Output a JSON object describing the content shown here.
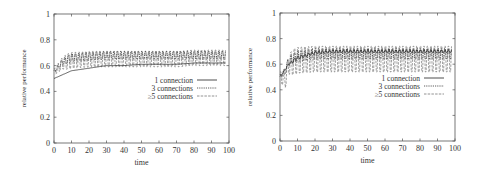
{
  "chart_data": [
    {
      "type": "line",
      "title": "",
      "xlabel": "time",
      "ylabel": "relative performance",
      "xlim": [
        0,
        100
      ],
      "ylim": [
        0,
        1
      ],
      "xticks": [
        "0",
        "10",
        "20",
        "30",
        "40",
        "50",
        "60",
        "70",
        "80",
        "90",
        "100"
      ],
      "yticks": [
        "0",
        "0.2",
        "0.4",
        "0.6",
        "0.8",
        "1"
      ],
      "grid": false,
      "legend_position": "center-right",
      "series": [
        {
          "name": "1 connection",
          "style": "solid",
          "baseline_start": 0.5,
          "baseline_end": 0.61,
          "oscillation": 0.0
        },
        {
          "name": "3 connections",
          "style": "dotted",
          "baseline_start": 0.55,
          "baseline_end": 0.68,
          "oscillation": 0.03
        },
        {
          "name": "≥5 connections",
          "style": "dashed",
          "baseline_start": 0.55,
          "baseline_end": 0.65,
          "oscillation": 0.06
        }
      ],
      "approx_points": {
        "x": [
          0,
          5,
          10,
          20,
          30,
          40,
          50,
          60,
          70,
          80,
          90,
          98
        ],
        "1 connection": [
          0.5,
          0.53,
          0.56,
          0.58,
          0.6,
          0.6,
          0.61,
          0.61,
          0.61,
          0.62,
          0.62,
          0.62
        ],
        "3 connections": [
          0.55,
          0.63,
          0.66,
          0.67,
          0.68,
          0.68,
          0.68,
          0.68,
          0.68,
          0.68,
          0.68,
          0.68
        ],
        "≥5 connections": [
          0.55,
          0.62,
          0.64,
          0.65,
          0.65,
          0.65,
          0.65,
          0.65,
          0.65,
          0.66,
          0.66,
          0.66
        ]
      }
    },
    {
      "type": "line",
      "title": "",
      "xlabel": "time",
      "ylabel": "relative performance",
      "xlim": [
        0,
        100
      ],
      "ylim": [
        0,
        1
      ],
      "xticks": [
        "0",
        "10",
        "20",
        "30",
        "40",
        "50",
        "60",
        "70",
        "80",
        "90",
        "100"
      ],
      "yticks": [
        "0",
        "0.2",
        "0.4",
        "0.6",
        "0.8",
        "1"
      ],
      "grid": false,
      "legend_position": "center-right",
      "series": [
        {
          "name": "1 connection",
          "style": "solid",
          "baseline_start": 0.5,
          "baseline_end": 0.7,
          "oscillation": 0.01
        },
        {
          "name": "3 connections",
          "style": "dotted",
          "baseline_start": 0.5,
          "baseline_end": 0.68,
          "oscillation": 0.04
        },
        {
          "name": "≥5 connections",
          "style": "dashed",
          "baseline_start": 0.5,
          "baseline_end": 0.64,
          "oscillation": 0.1
        }
      ],
      "approx_points": {
        "x": [
          0,
          3,
          5,
          10,
          20,
          30,
          40,
          50,
          60,
          70,
          80,
          90,
          98
        ],
        "1 connection": [
          0.5,
          0.56,
          0.6,
          0.65,
          0.69,
          0.7,
          0.7,
          0.7,
          0.7,
          0.7,
          0.7,
          0.7,
          0.7
        ],
        "3 connections": [
          0.5,
          0.55,
          0.62,
          0.66,
          0.68,
          0.68,
          0.68,
          0.68,
          0.68,
          0.68,
          0.68,
          0.68,
          0.68
        ],
        "≥5 connections": [
          0.5,
          0.48,
          0.6,
          0.63,
          0.64,
          0.64,
          0.64,
          0.64,
          0.64,
          0.64,
          0.64,
          0.64,
          0.64
        ]
      }
    }
  ],
  "layout": {
    "plots": [
      {
        "left": 54,
        "right": 229,
        "top": 14,
        "bottom": 143,
        "legend_x": 193,
        "legend_y": 80
      },
      {
        "left": 280,
        "right": 455,
        "top": 13,
        "bottom": 141,
        "legend_x": 420,
        "legend_y": 78
      }
    ]
  }
}
